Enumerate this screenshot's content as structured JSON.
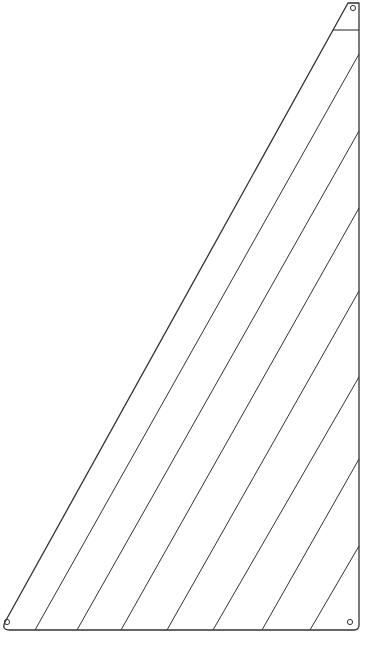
{
  "diagram": {
    "type": "sail-panel-layout",
    "stroke_color": "#333333",
    "background": "#ffffff",
    "outline": {
      "bottom_left": [
        4,
        630
      ],
      "bottom_right": [
        359,
        630
      ],
      "head_left": [
        348,
        3
      ],
      "head_right": [
        359,
        3
      ]
    },
    "head_board_line_y": 30,
    "grommets": [
      {
        "name": "head-grommet",
        "cx": 353,
        "cy": 8,
        "r": 2.6
      },
      {
        "name": "tack-grommet",
        "cx": 7,
        "cy": 622,
        "r": 2.6
      },
      {
        "name": "clew-grommet",
        "cx": 350,
        "cy": 622,
        "r": 2.6
      }
    ],
    "seams": [
      {
        "x1": 35,
        "y1": 630,
        "x2": 359,
        "y2": 54
      },
      {
        "x1": 77,
        "y1": 630,
        "x2": 359,
        "y2": 131
      },
      {
        "x1": 121,
        "y1": 630,
        "x2": 359,
        "y2": 208
      },
      {
        "x1": 167,
        "y1": 630,
        "x2": 359,
        "y2": 291
      },
      {
        "x1": 213,
        "y1": 630,
        "x2": 359,
        "y2": 377
      },
      {
        "x1": 262,
        "y1": 630,
        "x2": 359,
        "y2": 459
      },
      {
        "x1": 310,
        "y1": 630,
        "x2": 359,
        "y2": 546
      }
    ]
  }
}
